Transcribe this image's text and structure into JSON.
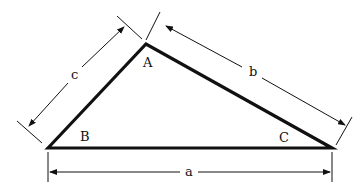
{
  "diagram": {
    "type": "triangle-dimensions",
    "vertices": {
      "A": {
        "label": "A",
        "x": 146,
        "y": 44
      },
      "B": {
        "label": "B",
        "x": 48,
        "y": 148
      },
      "C": {
        "label": "C",
        "x": 332,
        "y": 148
      }
    },
    "sides": {
      "a": {
        "label": "a"
      },
      "b": {
        "label": "b"
      },
      "c": {
        "label": "c"
      }
    },
    "colors": {
      "stroke": "#111111",
      "background": "#ffffff"
    }
  }
}
